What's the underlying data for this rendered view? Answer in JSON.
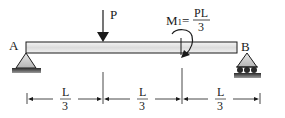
{
  "diagram": {
    "type": "simply-supported-beam",
    "support_left": {
      "label": "A",
      "kind": "pin"
    },
    "support_right": {
      "label": "B",
      "kind": "roller"
    },
    "point_load": {
      "label": "P",
      "position_fraction": "1/3"
    },
    "moment": {
      "symbol": "M",
      "subscript": "1",
      "equals": "=",
      "numerator": "PL",
      "denominator": "3",
      "direction": "clockwise",
      "position_fraction": "2/3"
    },
    "dimensions": [
      {
        "numerator": "L",
        "denominator": "3"
      },
      {
        "numerator": "L",
        "denominator": "3"
      },
      {
        "numerator": "L",
        "denominator": "3"
      }
    ],
    "colors": {
      "line": "#1a1a1a",
      "beam_fill": "#e6e6e6",
      "support_fill": "#c8c8c8",
      "ground": "#3a3a3a"
    }
  }
}
